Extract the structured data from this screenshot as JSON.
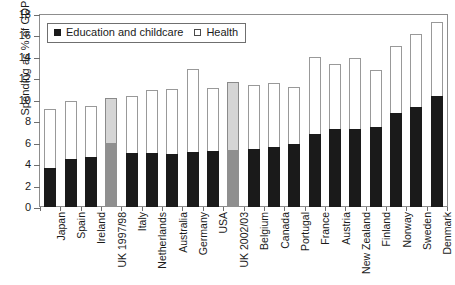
{
  "chart_data": {
    "type": "bar",
    "stacked": true,
    "title": "",
    "xlabel": "",
    "ylabel": "Spending as % of GDP",
    "ylim": [
      0,
      18
    ],
    "ytick_step": 2,
    "yticks": [
      "18",
      "16",
      "14",
      "12",
      "10",
      "8",
      "6",
      "4",
      "2",
      "0"
    ],
    "grid": false,
    "legend_position": "top-left-inside",
    "legend": [
      {
        "label": "Education and childcare",
        "marker": "filled-square",
        "color": "#1a1a1a"
      },
      {
        "label": "Health",
        "marker": "open-square",
        "color": "#ffffff"
      }
    ],
    "highlight_color": "#8f8f8f",
    "highlight_color_top": "#d5d5d5",
    "categories": [
      "Japan",
      "Spain",
      "Ireland",
      "UK 1997/98",
      "Italy",
      "Netherlands",
      "Australia",
      "Germany",
      "USA",
      "UK 2002/03",
      "Belgium",
      "Canada",
      "Portugal",
      "France",
      "Austria",
      "New Zealand",
      "Finland",
      "Norway",
      "Sweden",
      "Denmark"
    ],
    "highlighted_categories": [
      "UK 1997/98",
      "UK 2002/03"
    ],
    "series": [
      {
        "name": "Education and childcare",
        "values": [
          3.6,
          4.5,
          4.7,
          6.0,
          5.0,
          5.0,
          4.9,
          5.1,
          5.2,
          5.3,
          5.4,
          5.6,
          5.9,
          6.8,
          7.3,
          7.3,
          7.5,
          8.8,
          9.3,
          10.4
        ]
      },
      {
        "name": "Health",
        "values": [
          5.5,
          5.4,
          4.7,
          4.2,
          5.4,
          5.9,
          6.1,
          7.8,
          5.9,
          6.4,
          6.0,
          6.0,
          5.3,
          7.2,
          6.0,
          6.6,
          5.3,
          6.2,
          6.8,
          6.9
        ]
      }
    ],
    "totals": [
      9.1,
      9.9,
      9.4,
      10.2,
      10.4,
      10.9,
      11.0,
      12.9,
      11.1,
      11.7,
      11.4,
      11.6,
      11.2,
      14.0,
      13.3,
      13.9,
      12.8,
      15.0,
      16.1,
      17.3
    ]
  }
}
